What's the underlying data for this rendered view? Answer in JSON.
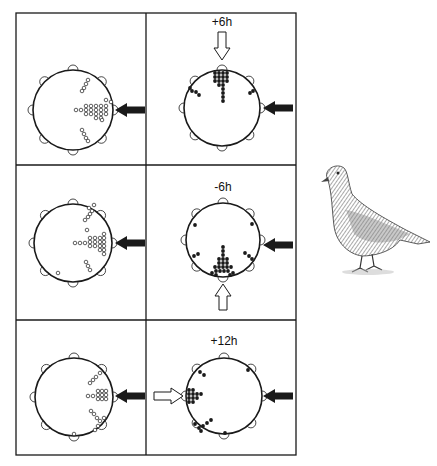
{
  "figure": {
    "frame": {
      "x": 16,
      "y": 13,
      "width": 280,
      "height": 442
    },
    "col_divider_x": 146,
    "row_dividers_y": [
      165,
      320
    ],
    "ink_color": "#1a1a1a",
    "open_arrow_color": "#ffffff"
  },
  "panels": [
    {
      "id": "control-top",
      "row": 0,
      "col": 0,
      "label": "",
      "center": [
        73,
        110
      ],
      "radius": 40,
      "dot_style": "open",
      "light_arrow": {
        "dir": "left",
        "x": 130,
        "y": 110
      },
      "shift_arrow": null,
      "perches": [
        0,
        45,
        90,
        135,
        180,
        225,
        270,
        315
      ],
      "dots": [
        [
          111,
          102
        ],
        [
          106,
          106
        ],
        [
          101,
          106
        ],
        [
          96,
          106
        ],
        [
          91,
          106
        ],
        [
          86,
          106
        ],
        [
          81,
          110
        ],
        [
          76,
          110
        ],
        [
          106,
          110
        ],
        [
          101,
          110
        ],
        [
          96,
          110
        ],
        [
          91,
          110
        ],
        [
          86,
          110
        ],
        [
          106,
          114
        ],
        [
          101,
          114
        ],
        [
          96,
          114
        ],
        [
          91,
          114
        ],
        [
          86,
          114
        ],
        [
          101,
          118
        ],
        [
          96,
          118
        ],
        [
          106,
          100
        ],
        [
          102,
          120
        ],
        [
          88,
          80
        ],
        [
          86,
          84
        ],
        [
          84,
          88
        ],
        [
          82,
          91
        ],
        [
          82,
          130
        ],
        [
          84,
          134
        ],
        [
          86,
          138
        ],
        [
          88,
          141
        ]
      ]
    },
    {
      "id": "shift-plus6",
      "row": 0,
      "col": 1,
      "label": "+6h",
      "center": [
        222,
        108
      ],
      "radius": 38,
      "dot_style": "filled",
      "light_arrow": {
        "dir": "left",
        "x": 278,
        "y": 108
      },
      "shift_arrow": {
        "dir": "down",
        "x": 222,
        "y1": 32,
        "y2": 60
      },
      "perches": [
        0,
        45,
        90,
        135,
        180,
        225,
        270,
        315
      ],
      "dots": [
        [
          215,
          73
        ],
        [
          219,
          73
        ],
        [
          223,
          73
        ],
        [
          227,
          73
        ],
        [
          215,
          77
        ],
        [
          219,
          77
        ],
        [
          223,
          77
        ],
        [
          227,
          77
        ],
        [
          215,
          81
        ],
        [
          219,
          81
        ],
        [
          223,
          81
        ],
        [
          227,
          81
        ],
        [
          219,
          85
        ],
        [
          223,
          85
        ],
        [
          223,
          89
        ],
        [
          223,
          93
        ],
        [
          223,
          97
        ],
        [
          223,
          101
        ],
        [
          190,
          88
        ],
        [
          192,
          91
        ],
        [
          196,
          92
        ],
        [
          199,
          95
        ],
        [
          253,
          91
        ],
        [
          250,
          93
        ]
      ]
    },
    {
      "id": "control-middle",
      "row": 1,
      "col": 0,
      "label": "",
      "center": [
        73,
        243
      ],
      "radius": 39,
      "dot_style": "open",
      "light_arrow": {
        "dir": "left",
        "x": 130,
        "y": 243
      },
      "shift_arrow": null,
      "perches": [
        0,
        45,
        90,
        135,
        180,
        225,
        270,
        315
      ],
      "dots": [
        [
          104,
          234
        ],
        [
          104,
          238
        ],
        [
          100,
          238
        ],
        [
          95,
          238
        ],
        [
          90,
          238
        ],
        [
          104,
          242
        ],
        [
          100,
          242
        ],
        [
          95,
          242
        ],
        [
          90,
          242
        ],
        [
          85,
          243
        ],
        [
          80,
          243
        ],
        [
          75,
          243
        ],
        [
          104,
          246
        ],
        [
          100,
          246
        ],
        [
          95,
          246
        ],
        [
          90,
          246
        ],
        [
          104,
          250
        ],
        [
          100,
          250
        ],
        [
          104,
          254
        ],
        [
          89,
          208
        ],
        [
          92,
          211
        ],
        [
          94,
          205
        ],
        [
          90,
          214
        ],
        [
          88,
          217
        ],
        [
          85,
          220
        ],
        [
          87,
          230
        ],
        [
          86,
          262
        ],
        [
          88,
          266
        ],
        [
          90,
          270
        ],
        [
          58,
          273
        ]
      ]
    },
    {
      "id": "shift-minus6",
      "row": 1,
      "col": 1,
      "label": "-6h",
      "center": [
        223,
        240
      ],
      "radius": 37,
      "dot_style": "filled",
      "light_arrow": {
        "dir": "left",
        "x": 278,
        "y": 245
      },
      "shift_arrow": {
        "dir": "up",
        "x": 223,
        "y1": 310,
        "y2": 284
      },
      "perches": [
        0,
        45,
        90,
        135,
        180,
        225,
        270,
        315
      ],
      "dots": [
        [
          223,
          247
        ],
        [
          223,
          251
        ],
        [
          223,
          255
        ],
        [
          219,
          259
        ],
        [
          223,
          259
        ],
        [
          227,
          259
        ],
        [
          219,
          263
        ],
        [
          223,
          263
        ],
        [
          227,
          263
        ],
        [
          215,
          267
        ],
        [
          219,
          267
        ],
        [
          223,
          267
        ],
        [
          227,
          267
        ],
        [
          231,
          267
        ],
        [
          212,
          273
        ],
        [
          216,
          271
        ],
        [
          220,
          271
        ],
        [
          224,
          271
        ],
        [
          228,
          271
        ],
        [
          233,
          273
        ],
        [
          216,
          275
        ],
        [
          230,
          275
        ],
        [
          195,
          225
        ],
        [
          252,
          224
        ],
        [
          194,
          256
        ],
        [
          198,
          254
        ],
        [
          245,
          253
        ],
        [
          249,
          256
        ],
        [
          252,
          259
        ]
      ]
    },
    {
      "id": "control-bottom",
      "row": 2,
      "col": 0,
      "label": "",
      "center": [
        74,
        397
      ],
      "radius": 39,
      "dot_style": "open",
      "light_arrow": {
        "dir": "left",
        "x": 130,
        "y": 396
      },
      "shift_arrow": null,
      "perches": [
        0,
        45,
        90,
        135,
        180,
        225,
        270,
        315
      ],
      "dots": [
        [
          98,
          391
        ],
        [
          102,
          391
        ],
        [
          106,
          391
        ],
        [
          98,
          395
        ],
        [
          102,
          395
        ],
        [
          106,
          395
        ],
        [
          98,
          399
        ],
        [
          102,
          399
        ],
        [
          106,
          399
        ],
        [
          93,
          396
        ],
        [
          88,
          396
        ],
        [
          96,
          377
        ],
        [
          93,
          380
        ],
        [
          90,
          383
        ],
        [
          100,
          373
        ],
        [
          91,
          411
        ],
        [
          94,
          414
        ],
        [
          97,
          418
        ],
        [
          100,
          421
        ],
        [
          104,
          418
        ],
        [
          98,
          426
        ],
        [
          95,
          430
        ],
        [
          74,
          434
        ]
      ]
    },
    {
      "id": "shift-plus12",
      "row": 2,
      "col": 1,
      "label": "+12h",
      "center": [
        224,
        396
      ],
      "radius": 38,
      "dot_style": "filled",
      "light_arrow": {
        "dir": "left",
        "x": 278,
        "y": 396
      },
      "shift_arrow": {
        "dir": "right",
        "y": 396,
        "x1": 154,
        "x2": 183
      },
      "perches": [
        0,
        45,
        90,
        135,
        180,
        225,
        270,
        315
      ],
      "dots": [
        [
          189,
          390
        ],
        [
          193,
          390
        ],
        [
          189,
          394
        ],
        [
          193,
          394
        ],
        [
          197,
          394
        ],
        [
          201,
          394
        ],
        [
          189,
          398
        ],
        [
          193,
          398
        ],
        [
          197,
          398
        ],
        [
          189,
          402
        ],
        [
          193,
          402
        ],
        [
          200,
          372
        ],
        [
          204,
          375
        ],
        [
          248,
          370
        ],
        [
          211,
          420
        ],
        [
          207,
          423
        ],
        [
          203,
          426
        ],
        [
          199,
          428
        ],
        [
          201,
          431
        ],
        [
          195,
          424
        ],
        [
          225,
          433
        ]
      ]
    }
  ],
  "pigeon": {
    "description": "pencil illustration of a homing pigeon facing left",
    "x": 318,
    "y": 160,
    "width": 115,
    "height": 120
  }
}
